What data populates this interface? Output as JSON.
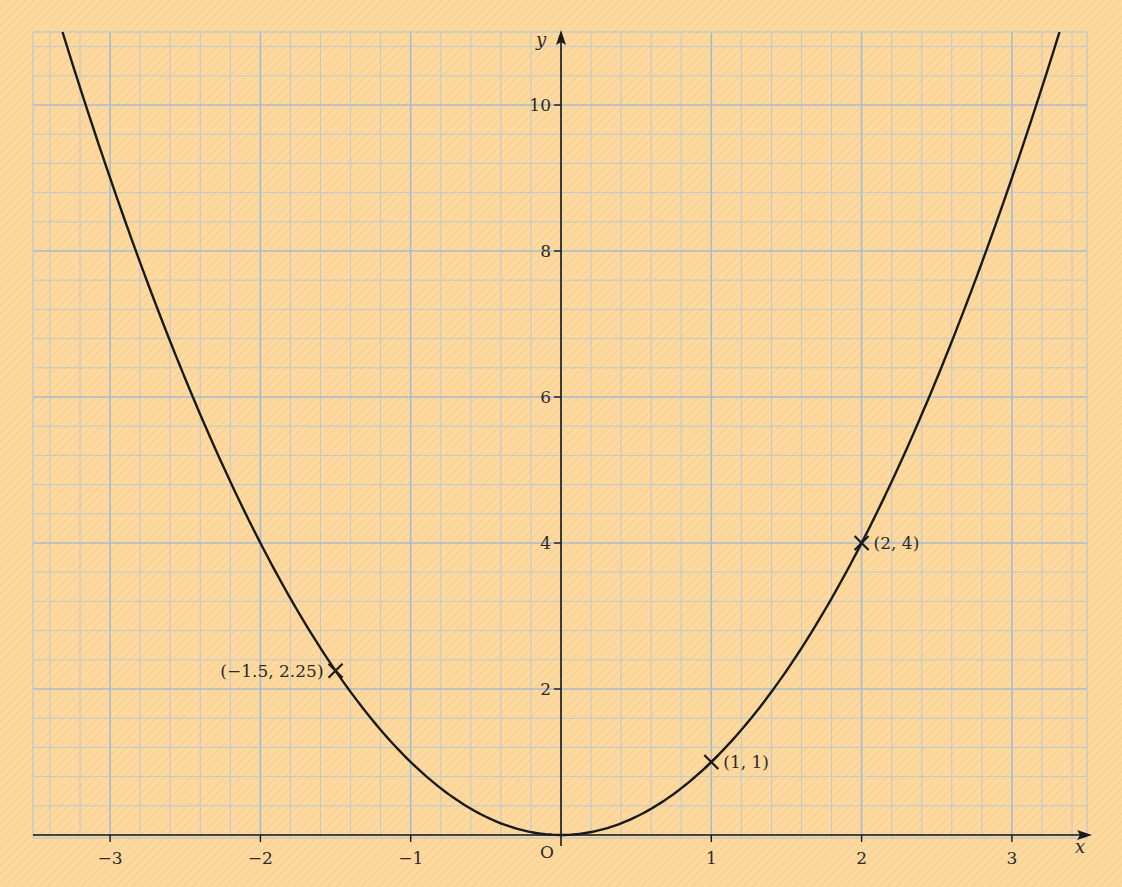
{
  "figure": {
    "background_color": "#fdd9a0",
    "grid_minor_color": "#b9c7cf",
    "grid_major_color": "#a7bccb",
    "curve_color": "#1a1a1a",
    "axis_color": "#1a1a1a"
  },
  "axes": {
    "x_label": "x",
    "y_label": "y",
    "origin_label": "O",
    "x_ticks": [
      {
        "value": -3,
        "label": "−3"
      },
      {
        "value": -2,
        "label": "−2"
      },
      {
        "value": -1,
        "label": "−1"
      },
      {
        "value": 1,
        "label": "1"
      },
      {
        "value": 2,
        "label": "2"
      },
      {
        "value": 3,
        "label": "3"
      }
    ],
    "y_ticks": [
      {
        "value": 2,
        "label": "2"
      },
      {
        "value": 4,
        "label": "4"
      },
      {
        "value": 6,
        "label": "6"
      },
      {
        "value": 8,
        "label": "8"
      },
      {
        "value": 10,
        "label": "10"
      }
    ]
  },
  "points": [
    {
      "x": -1.5,
      "y": 2.25,
      "label": "(−1.5, 2.25)",
      "label_side": "left"
    },
    {
      "x": 1,
      "y": 1,
      "label": "(1, 1)",
      "label_side": "right"
    },
    {
      "x": 2,
      "y": 4,
      "label": "(2, 4)",
      "label_side": "right"
    }
  ],
  "chart_data": {
    "type": "line",
    "title": "",
    "function": "y = x^2",
    "xlabel": "x",
    "ylabel": "y",
    "xlim": [
      -3.5,
      3.5
    ],
    "ylim": [
      0,
      11
    ],
    "x_ticks": [
      -3,
      -2,
      -1,
      0,
      1,
      2,
      3
    ],
    "y_ticks": [
      0,
      2,
      4,
      6,
      8,
      10
    ],
    "grid": true,
    "grid_minor_step_x": 0.2,
    "grid_minor_step_y": 0.4,
    "series": [
      {
        "name": "y = x^2",
        "x": [
          -3.3,
          -3,
          -2.5,
          -2,
          -1.5,
          -1,
          -0.5,
          0,
          0.5,
          1,
          1.5,
          2,
          2.5,
          3,
          3.3
        ],
        "y": [
          10.89,
          9,
          6.25,
          4,
          2.25,
          1,
          0.25,
          0,
          0.25,
          1,
          2.25,
          4,
          6.25,
          9,
          10.89
        ]
      }
    ],
    "annotations": [
      {
        "x": -1.5,
        "y": 2.25,
        "text": "(−1.5, 2.25)",
        "marker": "x"
      },
      {
        "x": 1,
        "y": 1,
        "text": "(1, 1)",
        "marker": "x"
      },
      {
        "x": 2,
        "y": 4,
        "text": "(2, 4)",
        "marker": "x"
      }
    ]
  }
}
